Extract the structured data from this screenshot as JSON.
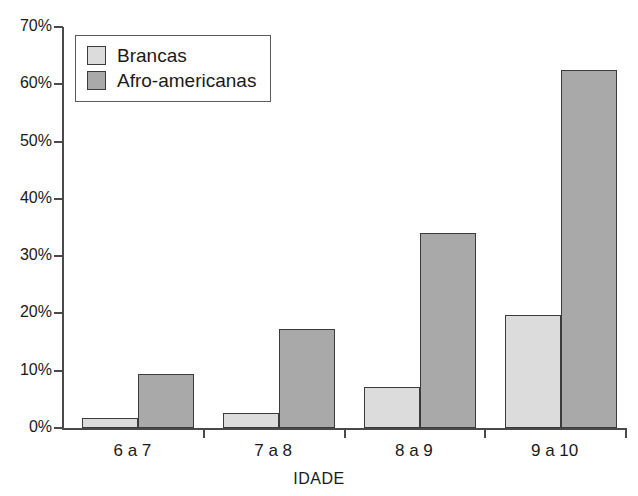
{
  "chart_data": {
    "type": "bar",
    "title": "",
    "xlabel": "IDADE",
    "ylabel": "",
    "categories": [
      "6 a 7",
      "7 a 8",
      "8 a 9",
      "9 a 10"
    ],
    "series": [
      {
        "name": "Brancas",
        "color": "#dcdcdc",
        "values": [
          1.7,
          2.7,
          7.2,
          19.7
        ]
      },
      {
        "name": "Afro-americanas",
        "color": "#a9a9a9",
        "values": [
          9.4,
          17.2,
          34.0,
          62.5
        ]
      }
    ],
    "ylim": [
      0,
      70
    ],
    "ytick_values": [
      0,
      10,
      20,
      30,
      40,
      50,
      60,
      70
    ],
    "ytick_labels": [
      "0%",
      "10%",
      "20%",
      "30%",
      "40%",
      "50%",
      "60%",
      "70%"
    ],
    "grid": false,
    "legend_position": "top-left"
  },
  "legend": {
    "entries": [
      {
        "label": "Brancas"
      },
      {
        "label": "Afro-americanas"
      }
    ]
  },
  "axes": {
    "x_title": "IDADE"
  }
}
